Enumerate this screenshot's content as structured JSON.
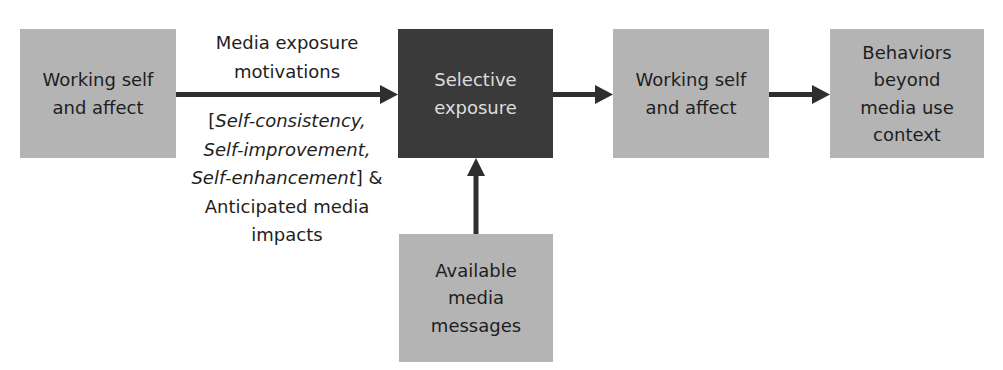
{
  "diagram": {
    "nodes": {
      "working_self_affect_1": {
        "lines": [
          "Working self",
          "and affect"
        ]
      },
      "selective_exposure": {
        "lines": [
          "Selective",
          "exposure"
        ]
      },
      "working_self_affect_2": {
        "lines": [
          "Working self",
          "and affect"
        ]
      },
      "behaviors": {
        "lines": [
          "Behaviors",
          "beyond",
          "media use",
          "context"
        ]
      },
      "available_media": {
        "lines": [
          "Available",
          "media",
          "messages"
        ]
      }
    },
    "edge_label_top": {
      "lines": [
        "Media exposure",
        "motivations"
      ]
    },
    "edge_label_bottom": {
      "bracket_open": "[",
      "italic_1": "Self-consistency,",
      "italic_2": "Self-improvement,",
      "italic_3": "Self-enhancement",
      "bracket_close_amp": "] &",
      "line_4": "Anticipated media",
      "line_5": "impacts"
    },
    "edges": [
      {
        "from": "working_self_affect_1",
        "to": "selective_exposure"
      },
      {
        "from": "selective_exposure",
        "to": "working_self_affect_2"
      },
      {
        "from": "working_self_affect_2",
        "to": "behaviors"
      },
      {
        "from": "available_media",
        "to": "selective_exposure"
      }
    ],
    "colors": {
      "box": "#b4b4b4",
      "dark_box": "#3a3a3a",
      "arrow": "#2e2e2e",
      "dark_text": "#dedede"
    }
  }
}
